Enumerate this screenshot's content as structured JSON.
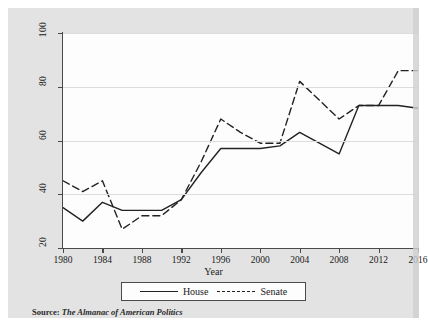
{
  "figure": {
    "xlabel": "Year",
    "source_label": "Source:",
    "source_value": "The Almanac of American Politics",
    "background_color": "#e3e3e3",
    "plot_background_color": "#fdfdfd",
    "axis_color": "#4a4a4a",
    "grid_color": "#dddddd"
  },
  "legend": {
    "items": [
      {
        "label": "House",
        "style": "solid",
        "color": "#222222"
      },
      {
        "label": "Senate",
        "style": "dashed",
        "color": "#222222"
      }
    ]
  },
  "chart_data": {
    "type": "line",
    "title": "",
    "xlabel": "Year",
    "ylabel": "",
    "xlim": [
      1980,
      2016
    ],
    "ylim": [
      20,
      100
    ],
    "xticks": [
      1980,
      1984,
      1988,
      1992,
      1996,
      2000,
      2004,
      2008,
      2012,
      2016
    ],
    "xtick_labels": [
      "1980",
      "1984",
      "1988",
      "1992",
      "1996",
      "2000",
      "2004",
      "2008",
      "2012",
      "2016"
    ],
    "yticks": [
      20,
      40,
      60,
      80,
      100
    ],
    "ytick_labels": [
      "20",
      "40",
      "60",
      "80",
      "100"
    ],
    "grid": true,
    "grid_axis": "y",
    "legend_position": "below-axis",
    "x": [
      1980,
      1982,
      1984,
      1986,
      1988,
      1990,
      1992,
      1994,
      1996,
      1998,
      2000,
      2002,
      2004,
      2006,
      2008,
      2010,
      2012,
      2014,
      2016
    ],
    "series": [
      {
        "name": "House",
        "style": "solid",
        "color": "#222222",
        "values": [
          35,
          30,
          37,
          34,
          34,
          34,
          38,
          48,
          57,
          57,
          57,
          58,
          63,
          59,
          55,
          73,
          73,
          73,
          72
        ]
      },
      {
        "name": "Senate",
        "style": "dashed",
        "color": "#222222",
        "values": [
          45,
          41,
          45,
          27,
          32,
          32,
          38,
          52,
          68,
          63,
          59,
          59,
          82,
          75,
          68,
          73,
          73,
          86,
          86
        ]
      }
    ]
  }
}
